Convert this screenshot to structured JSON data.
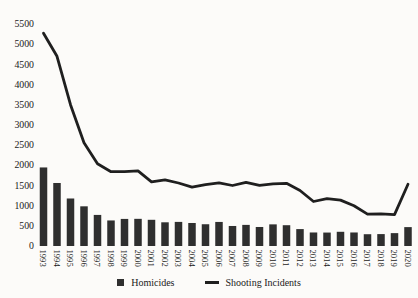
{
  "chart_data": {
    "type": "bar+line",
    "title": "",
    "xlabel": "",
    "ylabel": "",
    "categories": [
      "1993",
      "1994",
      "1995",
      "1996",
      "1997",
      "1998",
      "1999",
      "2000",
      "2001",
      "2002",
      "2003",
      "2004",
      "2005",
      "2006",
      "2007",
      "2008",
      "2009",
      "2010",
      "2011",
      "2012",
      "2013",
      "2014",
      "2015",
      "2016",
      "2017",
      "2018",
      "2019",
      "2020"
    ],
    "series": [
      {
        "name": "Homicides",
        "chart_type": "bar",
        "color": "#2f2f2f",
        "values": [
          1946,
          1561,
          1177,
          983,
          770,
          633,
          671,
          673,
          649,
          587,
          597,
          570,
          539,
          596,
          496,
          523,
          471,
          536,
          515,
          419,
          335,
          333,
          352,
          335,
          292,
          295,
          319,
          468
        ]
      },
      {
        "name": "Shooting Incidents",
        "chart_type": "line",
        "color": "#1f1f1f",
        "values": [
          5269,
          4700,
          3500,
          2560,
          2040,
          1840,
          1840,
          1860,
          1590,
          1640,
          1560,
          1460,
          1520,
          1566,
          1499,
          1578,
          1501,
          1541,
          1554,
          1376,
          1103,
          1172,
          1138,
          998,
          790,
          798,
          777,
          1531
        ]
      }
    ],
    "ylim": [
      0,
      5500
    ],
    "y_ticks": [
      0,
      500,
      1000,
      1500,
      2000,
      2500,
      3000,
      3500,
      4000,
      4500,
      5000,
      5500
    ],
    "grid": false,
    "legend_position": "bottom-center",
    "x_tick_rotation": 90
  },
  "colors": {
    "background": "#fcfbf9",
    "bar": "#2f2f2f",
    "line": "#1f1f1f",
    "text": "#1a1a1a"
  }
}
